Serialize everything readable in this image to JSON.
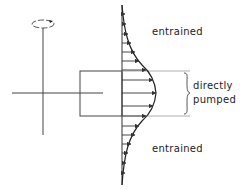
{
  "diagram": {
    "labels": {
      "entrained_top": "entrained",
      "directly": "directly",
      "pumped": "pumped",
      "entrained_bottom": "entrained"
    },
    "colors": {
      "stroke": "#333333",
      "guide": "#9a9a9a"
    }
  }
}
